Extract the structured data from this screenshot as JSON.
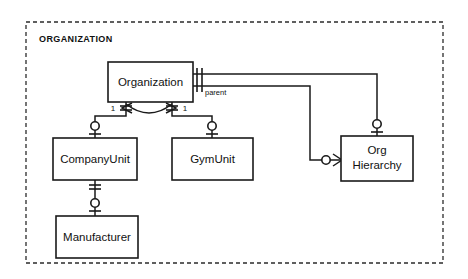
{
  "diagram": {
    "title": "ORGANIZATION",
    "notation": "crows-foot",
    "canvas": {
      "width": 468,
      "height": 279
    },
    "subject_area": {
      "label": "ORGANIZATION",
      "border_style": "dashed",
      "x": 26,
      "y": 22,
      "width": 417,
      "height": 241
    },
    "entities": [
      {
        "id": "organization",
        "label": "Organization",
        "x": 108,
        "y": 62,
        "width": 85,
        "height": 40
      },
      {
        "id": "company_unit",
        "label": "CompanyUnit",
        "x": 53,
        "y": 138,
        "width": 84,
        "height": 42
      },
      {
        "id": "gym_unit",
        "label": "GymUnit",
        "x": 172,
        "y": 138,
        "width": 81,
        "height": 42
      },
      {
        "id": "manufacturer",
        "label": "Manufacturer",
        "x": 56,
        "y": 216,
        "width": 82,
        "height": 42
      },
      {
        "id": "org_hierarchy",
        "label_lines": [
          "Org",
          "Hierarchy"
        ],
        "label": "Org Hierarchy",
        "x": 341,
        "y": 136,
        "width": 72,
        "height": 45
      }
    ],
    "relationships": [
      {
        "id": "org-to-companyunit",
        "from": "organization",
        "to": "company_unit",
        "from_cardinality": "1",
        "from_marker": "one-mandatory",
        "to_marker": "zero-or-one",
        "label": "1"
      },
      {
        "id": "org-to-gymunit",
        "from": "organization",
        "to": "gym_unit",
        "from_cardinality": "1",
        "from_marker": "one-mandatory",
        "to_marker": "zero-or-one",
        "label": "1"
      },
      {
        "id": "companyunit-to-manufacturer",
        "from": "company_unit",
        "to": "manufacturer",
        "from_marker": "one-mandatory",
        "to_marker": "zero-or-one",
        "label": ""
      },
      {
        "id": "org-to-orghierarchy-top",
        "from": "organization",
        "to": "org_hierarchy",
        "from_marker": "one-mandatory",
        "to_marker": "zero-or-one",
        "label": ""
      },
      {
        "id": "org-parent-to-orghierarchy",
        "from": "organization",
        "to": "org_hierarchy",
        "from_marker": "one-mandatory",
        "to_marker": "zero-or-many",
        "label": "parent"
      }
    ],
    "exclusive_arc": {
      "id": "org-subtype-arc",
      "between": [
        "org-to-companyunit",
        "org-to-gymunit"
      ],
      "description": "exclusive arc spanning the two Organization relationships"
    },
    "labels": {
      "parent": "parent",
      "cardinality_left": "1",
      "cardinality_right": "1"
    },
    "colors": {
      "line": "#1a1a1a",
      "border_dashed": "#2b2b2b",
      "box_fill": "#ffffff",
      "background": "#ffffff",
      "text": "#111111"
    }
  }
}
